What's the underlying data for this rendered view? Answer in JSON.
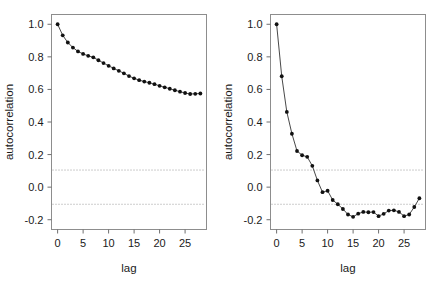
{
  "figure": {
    "title": "",
    "panel_count": 2,
    "background_color": "#ffffff"
  },
  "chart_data": [
    {
      "type": "line",
      "panel": "left",
      "title": "",
      "subtitle": "",
      "xlabel": "lag",
      "ylabel": "autocorrelation",
      "xlim": [
        -1.2,
        29.2
      ],
      "ylim": [
        -0.26,
        1.06
      ],
      "xticks": [
        0,
        5,
        10,
        15,
        20,
        25
      ],
      "xticklabels": [
        "0",
        "5",
        "10",
        "15",
        "20",
        "25"
      ],
      "yticks": [
        -0.2,
        0.0,
        0.2,
        0.4,
        0.6,
        0.8,
        1.0
      ],
      "yticklabels": [
        "-0.2",
        "0.0",
        "0.2",
        "0.4",
        "0.6",
        "0.8",
        "1.0"
      ],
      "grid": false,
      "legend": null,
      "markers": "filled-circle",
      "confidence_bounds": [
        0.105,
        -0.105
      ],
      "confidence_style": "dotted",
      "x": [
        0,
        1,
        2,
        3,
        4,
        5,
        6,
        7,
        8,
        9,
        10,
        11,
        12,
        13,
        14,
        15,
        16,
        17,
        18,
        19,
        20,
        21,
        22,
        23,
        24,
        25,
        26,
        27,
        28
      ],
      "values": [
        1.0,
        0.932,
        0.888,
        0.857,
        0.833,
        0.818,
        0.806,
        0.797,
        0.779,
        0.762,
        0.745,
        0.729,
        0.714,
        0.699,
        0.682,
        0.668,
        0.657,
        0.648,
        0.641,
        0.632,
        0.622,
        0.613,
        0.604,
        0.595,
        0.586,
        0.578,
        0.572,
        0.573,
        0.575
      ]
    },
    {
      "type": "line",
      "panel": "right",
      "title": "",
      "subtitle": "",
      "xlabel": "lag",
      "ylabel": "autocorrelation",
      "xlim": [
        -1.2,
        29.2
      ],
      "ylim": [
        -0.26,
        1.06
      ],
      "xticks": [
        0,
        5,
        10,
        15,
        20,
        25
      ],
      "xticklabels": [
        "0",
        "5",
        "10",
        "15",
        "20",
        "25"
      ],
      "yticks": [
        -0.2,
        0.0,
        0.2,
        0.4,
        0.6,
        0.8,
        1.0
      ],
      "yticklabels": [
        "-0.2",
        "0.0",
        "0.2",
        "0.4",
        "0.6",
        "0.8",
        "1.0"
      ],
      "grid": false,
      "legend": null,
      "markers": "filled-circle",
      "confidence_bounds": [
        0.105,
        -0.105
      ],
      "confidence_style": "dotted",
      "x": [
        0,
        1,
        2,
        3,
        4,
        5,
        6,
        7,
        8,
        9,
        10,
        11,
        12,
        13,
        14,
        15,
        16,
        17,
        18,
        19,
        20,
        21,
        22,
        23,
        24,
        25,
        26,
        27,
        28
      ],
      "values": [
        1.0,
        0.681,
        0.462,
        0.328,
        0.222,
        0.196,
        0.186,
        0.131,
        0.041,
        -0.031,
        -0.022,
        -0.079,
        -0.105,
        -0.134,
        -0.168,
        -0.182,
        -0.163,
        -0.152,
        -0.154,
        -0.153,
        -0.178,
        -0.164,
        -0.144,
        -0.142,
        -0.152,
        -0.178,
        -0.168,
        -0.122,
        -0.068
      ]
    }
  ],
  "axis_labels": {
    "x": "lag",
    "y": "autocorrelation"
  },
  "colors": {
    "line": "#333333",
    "marker": "#111111",
    "frame": "#8d8d8d",
    "confidence": "#9a9a9a",
    "text": "#1a1a1a"
  }
}
